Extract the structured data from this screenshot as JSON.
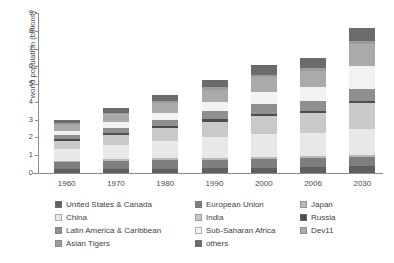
{
  "chart_data": {
    "type": "bar",
    "stacked": true,
    "title": "",
    "xlabel": "",
    "ylabel": "world population (billions)",
    "ylim": [
      0,
      9
    ],
    "yticks": [
      0,
      1,
      2,
      3,
      4,
      5,
      6,
      7,
      8,
      9
    ],
    "grid": false,
    "legend_position": "bottom",
    "categories": [
      "1960",
      "1970",
      "1980",
      "1990",
      "2000",
      "2006",
      "2030"
    ],
    "series": [
      {
        "name": "United States & Canada",
        "color": "#5f5f5f",
        "values": [
          0.2,
          0.23,
          0.25,
          0.28,
          0.31,
          0.33,
          0.4
        ]
      },
      {
        "name": "European Union",
        "color": "#7e7e7e",
        "values": [
          0.41,
          0.44,
          0.46,
          0.47,
          0.48,
          0.49,
          0.49
        ]
      },
      {
        "name": "Japan",
        "color": "#b8b8b8",
        "values": [
          0.09,
          0.1,
          0.12,
          0.12,
          0.13,
          0.13,
          0.12
        ]
      },
      {
        "name": "China",
        "color": "#e8e8e8",
        "values": [
          0.66,
          0.82,
          0.98,
          1.14,
          1.27,
          1.31,
          1.46
        ]
      },
      {
        "name": "India",
        "color": "#c9c9c9",
        "values": [
          0.45,
          0.55,
          0.7,
          0.87,
          1.01,
          1.1,
          1.45
        ]
      },
      {
        "name": "Russia",
        "color": "#4d4d4d",
        "values": [
          0.12,
          0.13,
          0.14,
          0.15,
          0.15,
          0.14,
          0.13
        ]
      },
      {
        "name": "Latin America & Caribbean",
        "color": "#8f8f8f",
        "values": [
          0.22,
          0.29,
          0.36,
          0.44,
          0.52,
          0.56,
          0.7
        ]
      },
      {
        "name": "Sub-Saharan Africa",
        "color": "#f2f2f2",
        "values": [
          0.23,
          0.29,
          0.38,
          0.51,
          0.67,
          0.76,
          1.25
        ]
      },
      {
        "name": "Dev11",
        "color": "#aaaaaa",
        "values": [
          0.35,
          0.45,
          0.56,
          0.7,
          0.84,
          0.92,
          1.27
        ]
      },
      {
        "name": "Asian Tigers",
        "color": "#9c9c9c",
        "values": [
          0.08,
          0.1,
          0.12,
          0.14,
          0.15,
          0.16,
          0.17
        ]
      },
      {
        "name": "others",
        "color": "#6b6b6b",
        "values": [
          0.19,
          0.27,
          0.33,
          0.43,
          0.54,
          0.59,
          0.71
        ]
      }
    ],
    "totals": [
      3.0,
      3.67,
      4.4,
      5.25,
      6.07,
      6.49,
      8.15
    ]
  },
  "legend": {
    "entries": [
      "United States & Canada",
      "European Union",
      "Japan",
      "China",
      "India",
      "Russia",
      "Latin America & Caribbean",
      "Sub-Saharan Africa",
      "Dev11",
      "Asian Tigers",
      "others"
    ]
  }
}
